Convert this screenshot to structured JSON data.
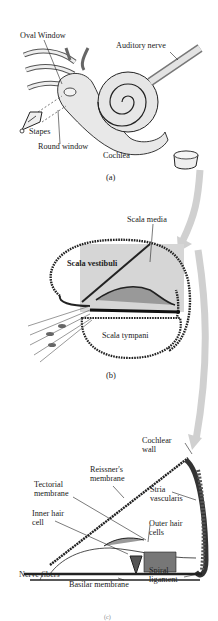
{
  "panel_a": {
    "caption": "(a)",
    "labels": {
      "oval_window": "Oval Window",
      "auditory_nerve": "Auditory nerve",
      "stapes": "Stapes",
      "round_window": "Round window",
      "cochlea": "Cochlea"
    }
  },
  "panel_b": {
    "caption": "(b)",
    "labels": {
      "scala_media": "Scala media",
      "scala_vestibuli": "Scala vestibuli",
      "scala_tympani": "Scala tympani"
    }
  },
  "panel_c": {
    "caption": "(c)",
    "labels": {
      "cochlear_wall": "Cochlear\nwall",
      "reissners_membrane": "Reissner's\nmembrane",
      "tectorial_membrane": "Tectorial\nmembrane",
      "stria_vascularis": "Stria\nvascularis",
      "inner_hair_cell": "Inner hair\ncell",
      "outer_hair_cells": "Outer hair\ncells",
      "nerve_fibers": "Nerve fibers",
      "basilar_membrane": "Basilar membrane",
      "spiral_ligament": "Spiral\nligament"
    }
  },
  "colors": {
    "ink": "#1a1a1a",
    "highlight_gray": "#d4d4d4",
    "arrow_gray": "#cfcfcf"
  }
}
